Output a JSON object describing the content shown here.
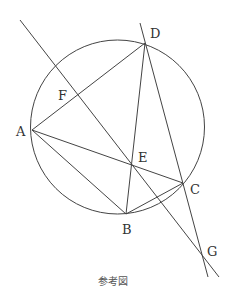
{
  "diagram": {
    "caption": "参考図",
    "circle": {
      "cx": 117.5,
      "cy": 127,
      "r": 87
    },
    "points": {
      "A": {
        "label": "A",
        "x": 32,
        "y": 130
      },
      "B": {
        "label": "B",
        "x": 126,
        "y": 214
      },
      "C": {
        "label": "C",
        "x": 183,
        "y": 183
      },
      "D": {
        "label": "D",
        "x": 145,
        "y": 43
      },
      "E": {
        "label": "E",
        "x": 132,
        "y": 165
      },
      "F": {
        "label": "F",
        "x": 78,
        "y": 95
      },
      "G": {
        "label": "G",
        "x": 203,
        "y": 258
      }
    },
    "segments": [
      "AD",
      "AC",
      "AB",
      "DB",
      "BC"
    ],
    "lines": [
      {
        "name": "line-through-F-E",
        "from": [
          20,
          20
        ],
        "to": [
          219,
          277
        ]
      },
      {
        "name": "line-through-D-C-G",
        "from": [
          140,
          23
        ],
        "to": [
          208,
          277
        ]
      }
    ]
  }
}
